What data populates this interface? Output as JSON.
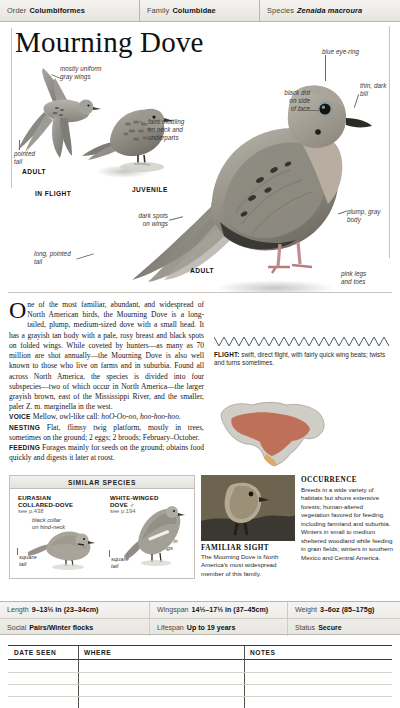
{
  "taxon": {
    "order_label": "Order",
    "order_value": "Columbiformes",
    "family_label": "Family",
    "family_value": "Columbidae",
    "species_label": "Species",
    "species_value": "Zenaida macroura"
  },
  "title": "Mourning Dove",
  "plate": {
    "callouts": [
      {
        "name": "callout-gray-wings",
        "text": "mostly uniform\ngray wings"
      },
      {
        "name": "callout-pointed-tail",
        "text": "pointed\ntail"
      },
      {
        "name": "callout-faint-mottling",
        "text": "faint mottling\non neck and\nunderparts"
      },
      {
        "name": "callout-dark-spots",
        "text": "dark spots\non wings"
      },
      {
        "name": "callout-long-pointed-tail",
        "text": "long, pointed\ntail"
      },
      {
        "name": "callout-blue-eye-ring",
        "text": "blue eye-ring"
      },
      {
        "name": "callout-thin-dark-bill",
        "text": "thin, dark\nbill"
      },
      {
        "name": "callout-black-dot",
        "text": "black dot\non side\nof face"
      },
      {
        "name": "callout-plump-body",
        "text": "plump, gray\nbody"
      },
      {
        "name": "callout-pink-legs",
        "text": "pink legs\nand toes"
      }
    ],
    "captions": {
      "adult_flight": "ADULT",
      "in_flight": "IN FLIGHT",
      "juvenile": "JUVENILE",
      "adult_perched": "ADULT"
    }
  },
  "account": {
    "dropcap": "O",
    "intro": "ne of the most familiar, abundant, and widespread of North American birds, the Mourning Dove is a long-tailed, plump, medium-sized dove with a small head. It has a grayish tan body with a pale, rosy breast and black spots on folded wings. While coveted by hunters—as many as 70 million are shot annually—the Mourning Dove is also well known to those who live on farms and in suburbia. Found all across North America, the species is divided into four subspecies—two of which occur in North America—the larger grayish brown, east of the Mississippi River, and the smaller, paler Z. m. marginella in the west.",
    "intro_italic_1": "Z. m. carolinensis,",
    "intro_italic_2": "Z. m. marginella",
    "voice_label": "VOICE",
    "voice_text": "Mellow, owl-like call:",
    "voice_call": "hoO-Oo-oo, hoo-hoo-hoo.",
    "nesting_label": "NESTING",
    "nesting_text": "Flat, flimsy twig platform, mostly in trees, sometimes on the ground; 2 eggs; 2 broods; February–October.",
    "feeding_label": "FEEDING",
    "feeding_text": "Forages mainly for seeds on the ground; obtains food quickly and digests it later at roost."
  },
  "flight": {
    "label": "FLIGHT:",
    "text": "swift, direct flight, with fairly quick wing beats; twists and turns sometimes."
  },
  "similar_species": {
    "heading": "SIMILAR SPECIES",
    "items": [
      {
        "name": "EURASIAN\nCOLLARED-DOVE",
        "page": "see p.438",
        "callouts": [
          "black collar\non hind-neck",
          "square\ntail"
        ]
      },
      {
        "name": "WHITE-WINGED\nDOVE ♂",
        "page": "see p.194",
        "callouts": [
          "white in\nwings",
          "square\ntail"
        ]
      }
    ]
  },
  "familiar_sight": {
    "title": "FAMILIAR SIGHT",
    "text": "The Mourning Dove is North America's most widespread member of this family."
  },
  "occurrence": {
    "title": "OCCURRENCE",
    "text": "Breeds in a wide variety of habitats but shuns extensive forests; human-altered vegetation favored for feeding, including farmland and suburbia. Winters in small to medium sheltered woodland while feeding in grain fields; winters in southern Mexico and Central America."
  },
  "stats": {
    "length_label": "Length",
    "length_value": "9–13½ in (23–34cm)",
    "wingspan_label": "Wingspan",
    "wingspan_value": "14½–17½ in (37–45cm)",
    "weight_label": "Weight",
    "weight_value": "3–6oz (85–175g)",
    "social_label": "Social",
    "social_value": "Pairs/Winter flocks",
    "lifespan_label": "Lifespan",
    "lifespan_value": "Up to 19 years",
    "status_label": "Status",
    "status_value": "Secure"
  },
  "notes_table": {
    "col_date": "DATE SEEN",
    "col_where": "WHERE",
    "col_notes": "NOTES"
  },
  "colors": {
    "rule": "#b9b6b0",
    "ink": "#111111",
    "bird_gray": "#8b8a84",
    "map_range": "#b9563a"
  }
}
